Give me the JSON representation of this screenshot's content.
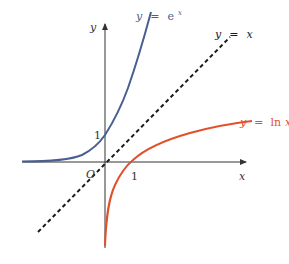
{
  "diagram": {
    "title": "",
    "axes": {
      "x_label": "x",
      "y_label": "y",
      "origin_label": "O",
      "x_tick_label": "1",
      "y_tick_label": "1"
    },
    "curves": [
      {
        "name": "exponential",
        "label_lhs": "y",
        "label_eq": "=",
        "label_rhs": "e",
        "label_sup": "x",
        "color": "#4a5f8f",
        "style": "solid"
      },
      {
        "name": "identity",
        "label_lhs": "y",
        "label_eq": "=",
        "label_rhs": "x",
        "color": "#1a1a1a",
        "style": "dashed"
      },
      {
        "name": "logarithm",
        "label_lhs": "y",
        "label_eq": "=",
        "label_rhs": "ln",
        "label_var": "x",
        "color": "#e0502a",
        "style": "solid"
      }
    ],
    "colors": {
      "axis": "#333333",
      "exp_curve": "#4a5f8f",
      "identity_line": "#1a1a1a",
      "log_curve": "#e0502a"
    }
  }
}
